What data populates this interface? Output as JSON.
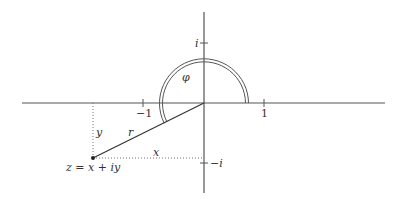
{
  "diagram": {
    "type": "complex-plane-polar-form",
    "labels": {
      "imag_unit": "i",
      "neg_imag_unit": "−i",
      "neg_one": "−1",
      "one": "1",
      "angle": "φ",
      "radius": "r",
      "x_component": "x",
      "y_component": "y",
      "point": "z = x + iy"
    },
    "colors": {
      "axis": "#555555",
      "line": "#333333",
      "dotted": "#777777",
      "arc": "#555555"
    }
  }
}
